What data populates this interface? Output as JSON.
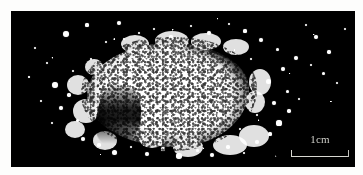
{
  "figure": {
    "kind": "macro-photograph",
    "background_color": "#000000",
    "particle_color": "#ffffff",
    "page_color": "#fdfdfc"
  },
  "scale_bar": {
    "label": "1cm",
    "length_px": 58,
    "line_color": "#d8d8d2",
    "position": "bottom-right"
  },
  "particles": {
    "note": "scattered grains surrounding the central heap",
    "grains": [
      {
        "x": 55,
        "y": 23,
        "d": 6.5
      },
      {
        "x": 76,
        "y": 14,
        "d": 3.2
      },
      {
        "x": 95,
        "y": 31,
        "d": 2.4
      },
      {
        "x": 108,
        "y": 12,
        "d": 4.0
      },
      {
        "x": 36,
        "y": 52,
        "d": 2.2
      },
      {
        "x": 44,
        "y": 74,
        "d": 5.8
      },
      {
        "x": 58,
        "y": 84,
        "d": 3.4
      },
      {
        "x": 50,
        "y": 97,
        "d": 4.6
      },
      {
        "x": 66,
        "y": 109,
        "d": 3.0
      },
      {
        "x": 41,
        "y": 112,
        "d": 2.6
      },
      {
        "x": 72,
        "y": 128,
        "d": 4.2
      },
      {
        "x": 88,
        "y": 134,
        "d": 3.6
      },
      {
        "x": 103,
        "y": 141,
        "d": 5.0
      },
      {
        "x": 120,
        "y": 136,
        "d": 2.8
      },
      {
        "x": 136,
        "y": 143,
        "d": 4.4
      },
      {
        "x": 152,
        "y": 138,
        "d": 3.2
      },
      {
        "x": 168,
        "y": 145,
        "d": 5.4
      },
      {
        "x": 186,
        "y": 139,
        "d": 3.0
      },
      {
        "x": 201,
        "y": 144,
        "d": 4.0
      },
      {
        "x": 217,
        "y": 136,
        "d": 3.4
      },
      {
        "x": 233,
        "y": 142,
        "d": 2.6
      },
      {
        "x": 246,
        "y": 131,
        "d": 4.8
      },
      {
        "x": 259,
        "y": 123,
        "d": 3.2
      },
      {
        "x": 268,
        "y": 112,
        "d": 5.2
      },
      {
        "x": 278,
        "y": 100,
        "d": 3.6
      },
      {
        "x": 263,
        "y": 92,
        "d": 4.4
      },
      {
        "x": 276,
        "y": 80,
        "d": 3.0
      },
      {
        "x": 288,
        "y": 88,
        "d": 2.4
      },
      {
        "x": 257,
        "y": 70,
        "d": 5.0
      },
      {
        "x": 272,
        "y": 58,
        "d": 3.8
      },
      {
        "x": 285,
        "y": 47,
        "d": 4.2
      },
      {
        "x": 266,
        "y": 38,
        "d": 3.0
      },
      {
        "x": 250,
        "y": 29,
        "d": 4.6
      },
      {
        "x": 234,
        "y": 20,
        "d": 3.2
      },
      {
        "x": 218,
        "y": 13,
        "d": 2.6
      },
      {
        "x": 198,
        "y": 22,
        "d": 3.8
      },
      {
        "x": 180,
        "y": 15,
        "d": 2.8
      },
      {
        "x": 160,
        "y": 26,
        "d": 3.4
      },
      {
        "x": 143,
        "y": 18,
        "d": 2.2
      },
      {
        "x": 305,
        "y": 26,
        "d": 4.0
      },
      {
        "x": 318,
        "y": 41,
        "d": 3.4
      },
      {
        "x": 312,
        "y": 62,
        "d": 3.0
      },
      {
        "x": 326,
        "y": 72,
        "d": 2.4
      },
      {
        "x": 300,
        "y": 54,
        "d": 2.0
      },
      {
        "x": 334,
        "y": 18,
        "d": 2.6
      },
      {
        "x": 295,
        "y": 14,
        "d": 2.2
      },
      {
        "x": 24,
        "y": 37,
        "d": 2.0
      },
      {
        "x": 30,
        "y": 90,
        "d": 1.8
      },
      {
        "x": 18,
        "y": 66,
        "d": 1.6
      },
      {
        "x": 62,
        "y": 60,
        "d": 2.8
      },
      {
        "x": 80,
        "y": 48,
        "d": 2.2
      },
      {
        "x": 92,
        "y": 68,
        "d": 3.6
      },
      {
        "x": 86,
        "y": 96,
        "d": 2.4
      },
      {
        "x": 113,
        "y": 28,
        "d": 2.0
      },
      {
        "x": 128,
        "y": 22,
        "d": 2.6
      },
      {
        "x": 240,
        "y": 48,
        "d": 2.2
      },
      {
        "x": 246,
        "y": 104,
        "d": 2.8
      },
      {
        "x": 229,
        "y": 118,
        "d": 2.0
      }
    ],
    "fringe_blobs": [
      {
        "x": 4,
        "y": 46,
        "w": 22,
        "h": 20
      },
      {
        "x": 10,
        "y": 70,
        "w": 26,
        "h": 24
      },
      {
        "x": 2,
        "y": 92,
        "w": 20,
        "h": 17
      },
      {
        "x": 22,
        "y": 30,
        "w": 18,
        "h": 16
      },
      {
        "x": 30,
        "y": 102,
        "w": 24,
        "h": 19
      },
      {
        "x": 58,
        "y": 6,
        "w": 28,
        "h": 18
      },
      {
        "x": 92,
        "y": 2,
        "w": 34,
        "h": 20
      },
      {
        "x": 128,
        "y": 4,
        "w": 30,
        "h": 17
      },
      {
        "x": 160,
        "y": 10,
        "w": 26,
        "h": 16
      },
      {
        "x": 176,
        "y": 96,
        "w": 30,
        "h": 22
      },
      {
        "x": 150,
        "y": 106,
        "w": 34,
        "h": 20
      },
      {
        "x": 110,
        "y": 108,
        "w": 30,
        "h": 20
      },
      {
        "x": 76,
        "y": 100,
        "w": 26,
        "h": 19
      },
      {
        "x": 186,
        "y": 40,
        "w": 22,
        "h": 26
      },
      {
        "x": 182,
        "y": 62,
        "w": 20,
        "h": 22
      }
    ]
  }
}
